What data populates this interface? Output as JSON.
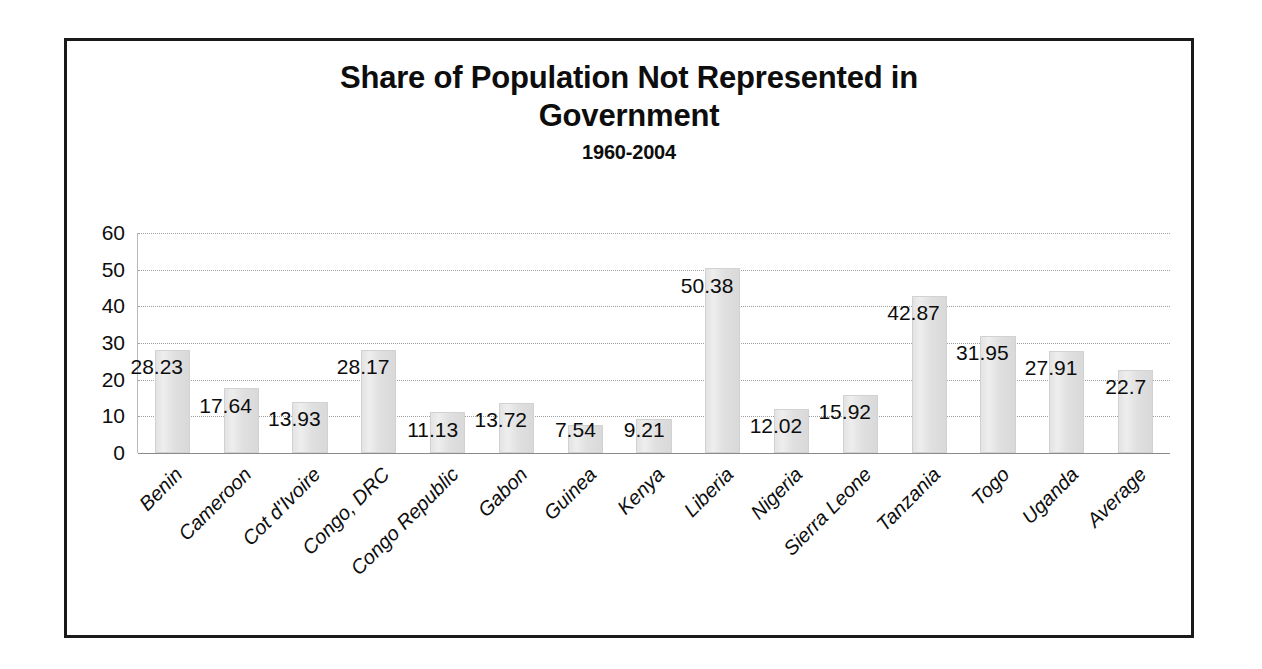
{
  "chart_data": {
    "type": "bar",
    "title": "Share of Population Not Represented in Government",
    "title_line1": "Share of Population Not Represented in",
    "title_line2": "Government",
    "subtitle": "1960-2004",
    "xlabel": "",
    "ylabel": "",
    "ylim": [
      0,
      60
    ],
    "ytick_step": 10,
    "yticks": [
      60,
      50,
      40,
      30,
      20,
      10,
      0
    ],
    "grid": true,
    "legend": false,
    "legend_position": "none",
    "categories": [
      "Benin",
      "Cameroon",
      "Cot d'Ivoire",
      "Congo, DRC",
      "Congo Republic",
      "Gabon",
      "Guinea",
      "Kenya",
      "Liberia",
      "Nigeria",
      "Sierra Leone",
      "Tanzania",
      "Togo",
      "Uganda",
      "Average"
    ],
    "values": [
      28.23,
      17.64,
      13.93,
      28.17,
      11.13,
      13.72,
      7.54,
      9.21,
      50.38,
      12.02,
      15.92,
      42.87,
      31.95,
      27.91,
      22.7
    ],
    "data_labels": [
      "28.23",
      "17.64",
      "13.93",
      "28.17",
      "11.13",
      "13.72",
      "7.54",
      "9.21",
      "50.38",
      "12.02",
      "15.92",
      "42.87",
      "31.95",
      "27.91",
      "22.7"
    ],
    "bar_color": "#e3e3e3",
    "bar_border_color": "#d2d2d2",
    "gridline_color": "#9e9e9e",
    "text_color": "#0d0d0d",
    "border_color": "#1a1a1a"
  }
}
